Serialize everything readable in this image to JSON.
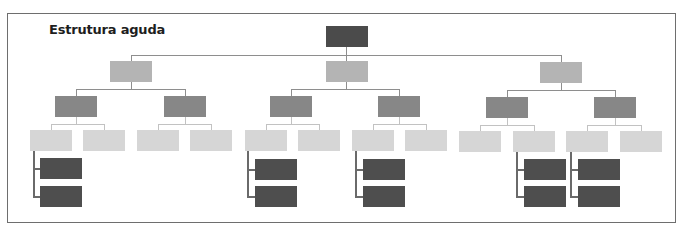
{
  "title": "Estrutura aguda",
  "colors": {
    "root": "#4b4b4b",
    "level1": "#b4b4b4",
    "level2": "#878787",
    "level3": "#d6d6d6",
    "level4": "#4e4e4e",
    "connector": "#8e8e8e",
    "frame_border": "#6e6e6e"
  },
  "tree": {
    "root": {
      "id": "root",
      "level": 0
    },
    "level1": [
      "left",
      "center",
      "right"
    ],
    "level2_per_level1": 2,
    "level3_per_level2": 2,
    "level4_groups": [
      {
        "parent": "left-L2a-L3a",
        "count": 2
      },
      {
        "parent": "center-L2a-L3a",
        "count": 2
      },
      {
        "parent": "center-L2b-L3a",
        "count": 2
      },
      {
        "parent": "right-L2a-L3b",
        "count": 2
      },
      {
        "parent": "right-L2b-L3a",
        "count": 2
      }
    ]
  }
}
